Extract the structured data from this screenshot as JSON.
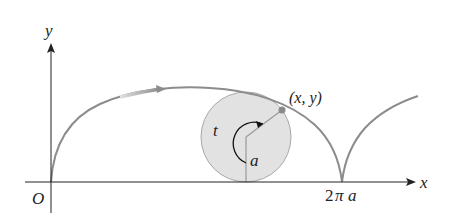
{
  "diagram": {
    "type": "cycloid",
    "labels": {
      "y_axis": "y",
      "x_axis": "x",
      "origin": "O",
      "point": "(x, y)",
      "angle": "t",
      "radius": "a",
      "cusp_num": "2",
      "cusp_pi": "π",
      "cusp_a": "a"
    },
    "colors": {
      "axis": "#222222",
      "curve": "#8c8c8c",
      "circle_fill": "#e2e2e2",
      "circle_stroke": "#a8a8a8",
      "point": "#8a8a8a"
    }
  }
}
